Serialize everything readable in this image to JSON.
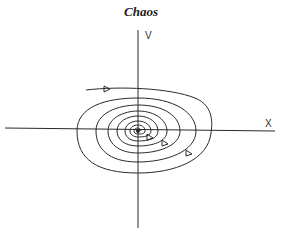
{
  "diagram": {
    "title": "Chaos",
    "type": "phase-portrait",
    "axes": {
      "x_label": "X",
      "y_label": "V"
    },
    "center": {
      "x": 138,
      "y": 130
    },
    "curve": "inward spiral trajectory converging to origin",
    "stroke_color": "#2a2a2a",
    "arrows": [
      {
        "x": 106,
        "y": 89,
        "direction": "right"
      },
      {
        "x": 150,
        "y": 137,
        "direction": "right"
      },
      {
        "x": 165,
        "y": 143,
        "direction": "right"
      },
      {
        "x": 189,
        "y": 153,
        "direction": "right"
      }
    ]
  }
}
